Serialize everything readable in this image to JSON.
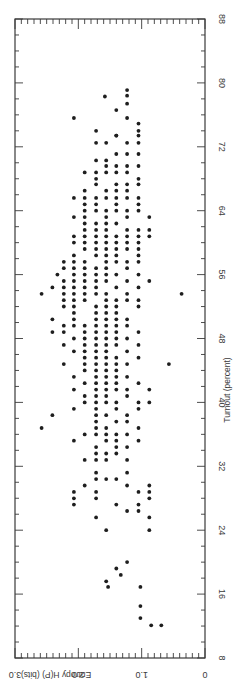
{
  "chart_data": {
    "type": "scatter",
    "orientation": "rotated-90-clockwise",
    "title": "",
    "xlabel": "Turnout (percent)",
    "ylabel": "Entropy H(P) (bits)",
    "xlim": [
      8,
      88
    ],
    "ylim": [
      0,
      3.0
    ],
    "x_ticks": [
      8,
      16,
      24,
      32,
      40,
      48,
      56,
      64,
      72,
      80,
      88
    ],
    "y_ticks": [
      0,
      1.0,
      2.0,
      3.0
    ],
    "y_tick_labels": [
      "0",
      "1.0",
      "2.0",
      "3.0"
    ],
    "grid": false,
    "legend": null,
    "series": [
      {
        "name": "constituencies",
        "points": [
          [
            79.1,
            1.23
          ],
          [
            78.4,
            1.23
          ],
          [
            77.4,
            1.23
          ],
          [
            78.3,
            1.58
          ],
          [
            76.6,
            1.4
          ],
          [
            75.6,
            1.23
          ],
          [
            75.6,
            2.07
          ],
          [
            74.9,
            1.05
          ],
          [
            74.0,
            1.05
          ],
          [
            73.4,
            1.05
          ],
          [
            74.0,
            1.72
          ],
          [
            73.4,
            1.4
          ],
          [
            73.4,
            1.4
          ],
          [
            72.5,
            1.05
          ],
          [
            72.5,
            1.72
          ],
          [
            72.5,
            1.56
          ],
          [
            72.5,
            1.23
          ],
          [
            71.1,
            1.4
          ],
          [
            71.1,
            1.23
          ],
          [
            71.1,
            1.05
          ],
          [
            70.3,
            1.72
          ],
          [
            70.3,
            1.56
          ],
          [
            69.6,
            1.56
          ],
          [
            69.6,
            1.4
          ],
          [
            69.6,
            1.23
          ],
          [
            69.6,
            1.05
          ],
          [
            68.8,
            1.9
          ],
          [
            68.8,
            1.72
          ],
          [
            68.8,
            1.56
          ],
          [
            68.8,
            1.4
          ],
          [
            68.8,
            1.23
          ],
          [
            68.0,
            1.72
          ],
          [
            68.0,
            1.05
          ],
          [
            67.3,
            1.72
          ],
          [
            67.3,
            1.4
          ],
          [
            67.3,
            1.23
          ],
          [
            67.3,
            1.05
          ],
          [
            66.5,
            1.9
          ],
          [
            66.5,
            1.56
          ],
          [
            66.5,
            1.4
          ],
          [
            66.5,
            1.23
          ],
          [
            65.6,
            2.07
          ],
          [
            65.6,
            1.9
          ],
          [
            65.6,
            1.72
          ],
          [
            65.6,
            1.56
          ],
          [
            65.6,
            1.4
          ],
          [
            65.6,
            1.23
          ],
          [
            65.6,
            1.05
          ],
          [
            64.8,
            1.9
          ],
          [
            64.8,
            1.72
          ],
          [
            64.8,
            1.4
          ],
          [
            64.8,
            1.05
          ],
          [
            64.0,
            1.9
          ],
          [
            64.0,
            1.72
          ],
          [
            64.0,
            1.56
          ],
          [
            64.0,
            1.4
          ],
          [
            64.0,
            1.23
          ],
          [
            64.0,
            1.05
          ],
          [
            63.2,
            2.07
          ],
          [
            63.2,
            1.9
          ],
          [
            63.2,
            1.56
          ],
          [
            63.2,
            1.23
          ],
          [
            63.2,
            0.88
          ],
          [
            62.4,
            1.9
          ],
          [
            62.4,
            1.72
          ],
          [
            62.4,
            1.56
          ],
          [
            62.4,
            1.4
          ],
          [
            61.6,
            1.9
          ],
          [
            61.6,
            1.72
          ],
          [
            61.6,
            1.56
          ],
          [
            61.6,
            1.23
          ],
          [
            61.6,
            1.05
          ],
          [
            61.6,
            0.88
          ],
          [
            60.8,
            2.07
          ],
          [
            60.8,
            1.9
          ],
          [
            60.8,
            1.72
          ],
          [
            60.8,
            1.56
          ],
          [
            60.8,
            1.4
          ],
          [
            60.8,
            1.23
          ],
          [
            60.8,
            1.05
          ],
          [
            60.8,
            0.88
          ],
          [
            60.0,
            2.07
          ],
          [
            60.0,
            1.9
          ],
          [
            60.0,
            1.72
          ],
          [
            60.0,
            1.56
          ],
          [
            60.0,
            1.4
          ],
          [
            60.0,
            1.23
          ],
          [
            60.0,
            1.05
          ],
          [
            59.2,
            1.9
          ],
          [
            59.2,
            1.72
          ],
          [
            59.2,
            1.56
          ],
          [
            59.2,
            1.4
          ],
          [
            59.2,
            1.23
          ],
          [
            59.2,
            1.05
          ],
          [
            58.4,
            2.07
          ],
          [
            58.4,
            1.72
          ],
          [
            58.4,
            1.56
          ],
          [
            58.4,
            1.4
          ],
          [
            58.4,
            1.05
          ],
          [
            57.6,
            2.23
          ],
          [
            57.6,
            2.07
          ],
          [
            57.6,
            1.9
          ],
          [
            57.6,
            1.56
          ],
          [
            57.6,
            1.4
          ],
          [
            57.6,
            1.23
          ],
          [
            57.6,
            1.05
          ],
          [
            56.8,
            2.23
          ],
          [
            56.8,
            2.07
          ],
          [
            56.8,
            1.9
          ],
          [
            56.8,
            1.72
          ],
          [
            56.8,
            1.56
          ],
          [
            56.8,
            1.23
          ],
          [
            56.0,
            2.33
          ],
          [
            56.0,
            2.07
          ],
          [
            56.0,
            1.9
          ],
          [
            56.0,
            1.72
          ],
          [
            56.0,
            1.56
          ],
          [
            56.0,
            1.4
          ],
          [
            56.0,
            1.05
          ],
          [
            55.2,
            2.23
          ],
          [
            55.2,
            2.07
          ],
          [
            55.2,
            1.9
          ],
          [
            55.2,
            1.72
          ],
          [
            55.2,
            1.56
          ],
          [
            55.2,
            1.23
          ],
          [
            55.2,
            0.88
          ],
          [
            54.4,
            2.41
          ],
          [
            54.4,
            2.23
          ],
          [
            54.4,
            2.07
          ],
          [
            54.4,
            1.9
          ],
          [
            54.4,
            1.72
          ],
          [
            54.4,
            1.4
          ],
          [
            54.4,
            1.05
          ],
          [
            53.6,
            2.58
          ],
          [
            53.6,
            2.23
          ],
          [
            53.6,
            2.07
          ],
          [
            53.6,
            1.9
          ],
          [
            53.6,
            1.72
          ],
          [
            53.6,
            1.56
          ],
          [
            53.6,
            1.23
          ],
          [
            53.6,
            0.37
          ],
          [
            52.8,
            2.23
          ],
          [
            52.8,
            2.07
          ],
          [
            52.8,
            1.9
          ],
          [
            52.8,
            1.56
          ],
          [
            52.8,
            1.4
          ],
          [
            52.8,
            1.23
          ],
          [
            52.8,
            1.05
          ],
          [
            52.0,
            2.23
          ],
          [
            52.0,
            2.07
          ],
          [
            52.0,
            1.72
          ],
          [
            52.0,
            1.56
          ],
          [
            52.0,
            1.4
          ],
          [
            52.0,
            1.05
          ],
          [
            51.2,
            2.07
          ],
          [
            51.2,
            1.72
          ],
          [
            51.2,
            1.56
          ],
          [
            51.2,
            1.4
          ],
          [
            50.4,
            2.41
          ],
          [
            50.4,
            2.07
          ],
          [
            50.4,
            1.72
          ],
          [
            50.4,
            1.56
          ],
          [
            50.4,
            1.4
          ],
          [
            50.4,
            1.23
          ],
          [
            49.6,
            2.23
          ],
          [
            49.6,
            2.07
          ],
          [
            49.6,
            1.9
          ],
          [
            49.6,
            1.72
          ],
          [
            49.6,
            1.56
          ],
          [
            49.6,
            1.4
          ],
          [
            49.6,
            1.23
          ],
          [
            48.8,
            2.41
          ],
          [
            48.8,
            2.23
          ],
          [
            48.8,
            1.9
          ],
          [
            48.8,
            1.72
          ],
          [
            48.8,
            1.56
          ],
          [
            48.8,
            1.4
          ],
          [
            48.8,
            1.05
          ],
          [
            48.0,
            2.07
          ],
          [
            48.0,
            1.9
          ],
          [
            48.0,
            1.72
          ],
          [
            48.0,
            1.56
          ],
          [
            48.0,
            1.4
          ],
          [
            48.0,
            1.23
          ],
          [
            47.2,
            2.23
          ],
          [
            47.2,
            1.9
          ],
          [
            47.2,
            1.72
          ],
          [
            47.2,
            1.56
          ],
          [
            47.2,
            1.4
          ],
          [
            47.2,
            1.05
          ],
          [
            46.4,
            2.07
          ],
          [
            46.4,
            1.9
          ],
          [
            46.4,
            1.72
          ],
          [
            46.4,
            1.56
          ],
          [
            46.4,
            1.23
          ],
          [
            45.6,
            1.9
          ],
          [
            45.6,
            1.72
          ],
          [
            45.6,
            1.56
          ],
          [
            45.6,
            1.4
          ],
          [
            45.6,
            1.05
          ],
          [
            44.8,
            2.23
          ],
          [
            44.8,
            1.9
          ],
          [
            44.8,
            1.72
          ],
          [
            44.8,
            1.56
          ],
          [
            44.8,
            1.4
          ],
          [
            44.8,
            1.23
          ],
          [
            44.8,
            0.57
          ],
          [
            44.0,
            1.9
          ],
          [
            44.0,
            1.72
          ],
          [
            44.0,
            1.56
          ],
          [
            44.0,
            1.4
          ],
          [
            43.2,
            2.07
          ],
          [
            43.2,
            1.72
          ],
          [
            43.2,
            1.56
          ],
          [
            43.2,
            1.4
          ],
          [
            43.2,
            1.23
          ],
          [
            42.4,
            1.9
          ],
          [
            42.4,
            1.72
          ],
          [
            42.4,
            1.56
          ],
          [
            42.4,
            1.4
          ],
          [
            42.4,
            1.05
          ],
          [
            41.6,
            2.07
          ],
          [
            41.6,
            1.72
          ],
          [
            41.6,
            1.56
          ],
          [
            41.6,
            1.4
          ],
          [
            41.6,
            1.23
          ],
          [
            41.6,
            0.88
          ],
          [
            40.8,
            1.9
          ],
          [
            40.8,
            1.72
          ],
          [
            40.8,
            1.56
          ],
          [
            40.8,
            1.23
          ],
          [
            40.0,
            1.9
          ],
          [
            40.0,
            1.72
          ],
          [
            40.0,
            1.56
          ],
          [
            40.0,
            1.4
          ],
          [
            40.0,
            1.05
          ],
          [
            40.0,
            0.88
          ],
          [
            39.2,
            2.07
          ],
          [
            39.2,
            1.72
          ],
          [
            39.2,
            1.4
          ],
          [
            39.2,
            1.05
          ],
          [
            38.4,
            2.41
          ],
          [
            38.4,
            1.72
          ],
          [
            38.4,
            1.56
          ],
          [
            38.4,
            1.23
          ],
          [
            37.6,
            1.72
          ],
          [
            37.6,
            1.4
          ],
          [
            37.6,
            1.23
          ],
          [
            36.8,
            2.58
          ],
          [
            36.8,
            1.72
          ],
          [
            36.8,
            1.56
          ],
          [
            36.8,
            1.05
          ],
          [
            36.0,
            1.9
          ],
          [
            36.0,
            1.72
          ],
          [
            36.0,
            1.56
          ],
          [
            36.0,
            1.4
          ],
          [
            36.0,
            1.23
          ],
          [
            35.2,
            2.07
          ],
          [
            35.2,
            1.56
          ],
          [
            35.2,
            1.4
          ],
          [
            35.2,
            1.05
          ],
          [
            34.4,
            1.72
          ],
          [
            34.4,
            1.4
          ],
          [
            34.4,
            1.23
          ],
          [
            33.6,
            1.72
          ],
          [
            33.6,
            1.56
          ],
          [
            33.6,
            1.4
          ],
          [
            32.8,
            1.9
          ],
          [
            32.8,
            1.72
          ],
          [
            32.8,
            1.56
          ],
          [
            32.8,
            1.23
          ],
          [
            31.2,
            1.72
          ],
          [
            31.2,
            1.23
          ],
          [
            30.4,
            1.72
          ],
          [
            30.4,
            1.56
          ],
          [
            30.4,
            1.4
          ],
          [
            29.6,
            1.9
          ],
          [
            29.6,
            1.23
          ],
          [
            29.6,
            0.88
          ],
          [
            28.8,
            2.07
          ],
          [
            28.8,
            1.72
          ],
          [
            28.8,
            1.05
          ],
          [
            28.8,
            0.88
          ],
          [
            28.0,
            2.07
          ],
          [
            28.0,
            1.72
          ],
          [
            28.0,
            0.88
          ],
          [
            27.2,
            2.07
          ],
          [
            27.2,
            1.4
          ],
          [
            27.2,
            1.05
          ],
          [
            26.4,
            1.23
          ],
          [
            26.4,
            1.05
          ],
          [
            25.6,
            1.72
          ],
          [
            25.6,
            0.88
          ],
          [
            24.0,
            1.56
          ],
          [
            24.0,
            0.88
          ],
          [
            20.0,
            1.23
          ],
          [
            19.2,
            1.4
          ],
          [
            17.6,
            1.56
          ],
          [
            18.4,
            1.33
          ],
          [
            16.9,
            1.53
          ],
          [
            16.9,
            1.02
          ],
          [
            14.5,
            1.02
          ],
          [
            13.0,
            1.02
          ],
          [
            12.1,
            0.85
          ],
          [
            12.1,
            0.69
          ]
        ]
      }
    ]
  },
  "axis": {
    "x_title": "Turnout (percent)",
    "y_title": "Entropy H(P) (bits)",
    "x_tick_labels": [
      "8",
      "16",
      "24",
      "32",
      "40",
      "48",
      "56",
      "64",
      "72",
      "80",
      "88"
    ],
    "y_tick_labels": [
      "0",
      "1.0",
      "2.0",
      "3.0"
    ]
  },
  "caption": "Figure: scatter of entropy H(P) against turnout (caption illegible)"
}
